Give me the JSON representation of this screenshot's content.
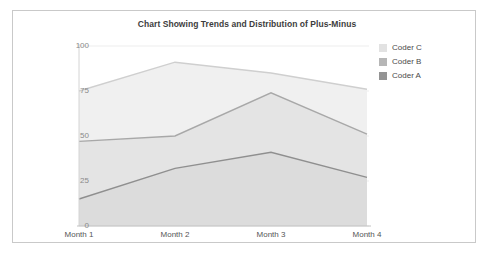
{
  "chart": {
    "title": "Chart Showing Trends and Distribution of Plus-Minus"
  },
  "legend": {
    "position": "top-right",
    "items": [
      {
        "label": "Coder C",
        "color": "#e2e2e2"
      },
      {
        "label": "Coder B",
        "color": "#b6b6b6"
      },
      {
        "label": "Coder A",
        "color": "#949494"
      }
    ]
  },
  "axes": {
    "y_ticks": [
      "100",
      "75",
      "50",
      "25",
      "0"
    ],
    "x_ticks": [
      "Month 1",
      "Month 2",
      "Month 3",
      "Month 4"
    ]
  },
  "caption": {
    "text": ""
  },
  "chart_data": {
    "type": "area",
    "title": "Chart Showing Trends and Distribution of Plus-Minus",
    "xlabel": "",
    "ylabel": "",
    "categories": [
      "Month 1",
      "Month 2",
      "Month 3",
      "Month 4"
    ],
    "series": [
      {
        "name": "Coder C",
        "values": [
          75,
          91,
          85,
          76
        ],
        "color": "#e2e2e2",
        "line_color": "#cfcfcf",
        "fill": "#f0f0f0"
      },
      {
        "name": "Coder B",
        "values": [
          47,
          50,
          74,
          51
        ],
        "color": "#b6b6b6",
        "line_color": "#a8a8a8",
        "fill": "#e4e4e4"
      },
      {
        "name": "Coder A",
        "values": [
          15,
          32,
          41,
          27
        ],
        "color": "#949494",
        "line_color": "#8f8f8f",
        "fill": "#dcdcdc"
      }
    ],
    "ylim": [
      0,
      100
    ],
    "yticks": [
      0,
      25,
      50,
      75,
      100
    ],
    "grid": true,
    "legend_position": "top-right",
    "stacked": false
  }
}
